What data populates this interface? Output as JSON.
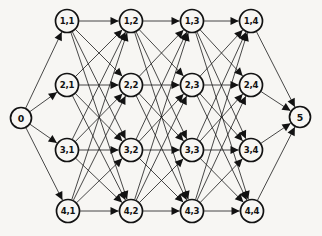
{
  "figure": {
    "title": "",
    "type": "layered-directed-graph",
    "background_color": "#f7f6f3",
    "node_fill": "#f7f6f3",
    "node_stroke": "#121212",
    "edge_color": "#1b1b1b",
    "width": 322,
    "height": 236
  },
  "graph": {
    "node_radius": 11.5,
    "terminal_radius": 10.5,
    "nodes": [
      {
        "id": "source",
        "label": "0",
        "x": 21,
        "y": 118,
        "r": 10.5,
        "terminal": true
      },
      {
        "id": "n-1-1",
        "label": "1,1",
        "x": 67,
        "y": 21,
        "r": 11.5,
        "terminal": false
      },
      {
        "id": "n-2-1",
        "label": "2,1",
        "x": 67,
        "y": 85,
        "r": 11.5,
        "terminal": false
      },
      {
        "id": "n-3-1",
        "label": "3,1",
        "x": 67,
        "y": 150,
        "r": 11.5,
        "terminal": false
      },
      {
        "id": "n-4-1",
        "label": "4,1",
        "x": 68,
        "y": 211,
        "r": 11.5,
        "terminal": false
      },
      {
        "id": "n-1-2",
        "label": "1,2",
        "x": 131,
        "y": 21,
        "r": 11.5,
        "terminal": false
      },
      {
        "id": "n-2-2",
        "label": "2,2",
        "x": 131,
        "y": 85,
        "r": 11.5,
        "terminal": false
      },
      {
        "id": "n-3-2",
        "label": "3,2",
        "x": 131,
        "y": 150,
        "r": 11.5,
        "terminal": false
      },
      {
        "id": "n-4-2",
        "label": "4,2",
        "x": 131,
        "y": 211,
        "r": 11.5,
        "terminal": false
      },
      {
        "id": "n-1-3",
        "label": "1,3",
        "x": 192,
        "y": 21,
        "r": 11.5,
        "terminal": false
      },
      {
        "id": "n-2-3",
        "label": "2,3",
        "x": 192,
        "y": 85,
        "r": 11.5,
        "terminal": false
      },
      {
        "id": "n-3-3",
        "label": "3,3",
        "x": 192,
        "y": 150,
        "r": 11.5,
        "terminal": false
      },
      {
        "id": "n-4-3",
        "label": "4,3",
        "x": 192,
        "y": 211,
        "r": 11.5,
        "terminal": false
      },
      {
        "id": "n-1-4",
        "label": "1,4",
        "x": 251,
        "y": 21,
        "r": 11.5,
        "terminal": false
      },
      {
        "id": "n-2-4",
        "label": "2,4",
        "x": 251,
        "y": 85,
        "r": 11.5,
        "terminal": false
      },
      {
        "id": "n-3-4",
        "label": "3,4",
        "x": 251,
        "y": 150,
        "r": 11.5,
        "terminal": false
      },
      {
        "id": "n-4-4",
        "label": "4,4",
        "x": 252,
        "y": 211,
        "r": 11.5,
        "terminal": false
      },
      {
        "id": "sink",
        "label": "5",
        "x": 300,
        "y": 117,
        "r": 10.5,
        "terminal": true
      }
    ],
    "edges": [
      {
        "from": "source",
        "to": "n-1-1"
      },
      {
        "from": "source",
        "to": "n-2-1"
      },
      {
        "from": "source",
        "to": "n-3-1"
      },
      {
        "from": "source",
        "to": "n-4-1"
      },
      {
        "from": "n-1-1",
        "to": "n-1-2"
      },
      {
        "from": "n-1-1",
        "to": "n-2-2"
      },
      {
        "from": "n-1-1",
        "to": "n-3-2"
      },
      {
        "from": "n-1-1",
        "to": "n-4-2"
      },
      {
        "from": "n-2-1",
        "to": "n-1-2"
      },
      {
        "from": "n-2-1",
        "to": "n-2-2"
      },
      {
        "from": "n-2-1",
        "to": "n-3-2"
      },
      {
        "from": "n-2-1",
        "to": "n-4-2"
      },
      {
        "from": "n-3-1",
        "to": "n-1-2"
      },
      {
        "from": "n-3-1",
        "to": "n-2-2"
      },
      {
        "from": "n-3-1",
        "to": "n-3-2"
      },
      {
        "from": "n-3-1",
        "to": "n-4-2"
      },
      {
        "from": "n-4-1",
        "to": "n-1-2"
      },
      {
        "from": "n-4-1",
        "to": "n-2-2"
      },
      {
        "from": "n-4-1",
        "to": "n-3-2"
      },
      {
        "from": "n-4-1",
        "to": "n-4-2"
      },
      {
        "from": "n-1-2",
        "to": "n-1-3"
      },
      {
        "from": "n-1-2",
        "to": "n-2-3"
      },
      {
        "from": "n-1-2",
        "to": "n-3-3"
      },
      {
        "from": "n-1-2",
        "to": "n-4-3"
      },
      {
        "from": "n-2-2",
        "to": "n-1-3"
      },
      {
        "from": "n-2-2",
        "to": "n-2-3"
      },
      {
        "from": "n-2-2",
        "to": "n-3-3"
      },
      {
        "from": "n-2-2",
        "to": "n-4-3"
      },
      {
        "from": "n-3-2",
        "to": "n-1-3"
      },
      {
        "from": "n-3-2",
        "to": "n-2-3"
      },
      {
        "from": "n-3-2",
        "to": "n-3-3"
      },
      {
        "from": "n-3-2",
        "to": "n-4-3"
      },
      {
        "from": "n-4-2",
        "to": "n-1-3"
      },
      {
        "from": "n-4-2",
        "to": "n-2-3"
      },
      {
        "from": "n-4-2",
        "to": "n-3-3"
      },
      {
        "from": "n-4-2",
        "to": "n-4-3"
      },
      {
        "from": "n-1-3",
        "to": "n-1-4"
      },
      {
        "from": "n-1-3",
        "to": "n-2-4"
      },
      {
        "from": "n-1-3",
        "to": "n-3-4"
      },
      {
        "from": "n-1-3",
        "to": "n-4-4"
      },
      {
        "from": "n-2-3",
        "to": "n-1-4"
      },
      {
        "from": "n-2-3",
        "to": "n-2-4"
      },
      {
        "from": "n-2-3",
        "to": "n-3-4"
      },
      {
        "from": "n-2-3",
        "to": "n-4-4"
      },
      {
        "from": "n-3-3",
        "to": "n-1-4"
      },
      {
        "from": "n-3-3",
        "to": "n-2-4"
      },
      {
        "from": "n-3-3",
        "to": "n-3-4"
      },
      {
        "from": "n-3-3",
        "to": "n-4-4"
      },
      {
        "from": "n-4-3",
        "to": "n-1-4"
      },
      {
        "from": "n-4-3",
        "to": "n-2-4"
      },
      {
        "from": "n-4-3",
        "to": "n-3-4"
      },
      {
        "from": "n-4-3",
        "to": "n-4-4"
      },
      {
        "from": "n-1-4",
        "to": "sink"
      },
      {
        "from": "n-2-4",
        "to": "sink"
      },
      {
        "from": "n-3-4",
        "to": "sink"
      },
      {
        "from": "n-4-4",
        "to": "sink"
      }
    ]
  }
}
